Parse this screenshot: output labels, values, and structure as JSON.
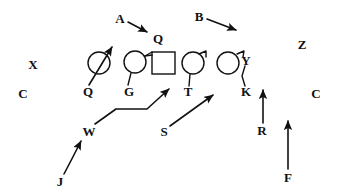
{
  "diagram": {
    "type": "american-football-play-formation",
    "canvas": {
      "width": 337,
      "height": 195
    },
    "stroke_color": "#111111",
    "background_color": "#ffffff",
    "offense": {
      "description": "Offensive line: four circles and one square (ball carrier / center marker)",
      "players": [
        {
          "id": "ol-1",
          "shape": "circle",
          "cx": 99,
          "cy": 63,
          "r": 11,
          "label": "Q",
          "label_x": 88,
          "label_y": 91
        },
        {
          "id": "ol-2",
          "shape": "circle",
          "cx": 135,
          "cy": 62,
          "r": 11,
          "label": "G",
          "label_x": 129,
          "label_y": 91
        },
        {
          "id": "ol-3",
          "shape": "square",
          "x": 152,
          "y": 52,
          "w": 23,
          "h": 22,
          "label": "",
          "label_x": 0,
          "label_y": 0
        },
        {
          "id": "ol-4",
          "shape": "circle",
          "cx": 193,
          "cy": 63,
          "r": 11,
          "label": "T",
          "label_x": 188,
          "label_y": 91
        },
        {
          "id": "ol-5",
          "shape": "circle",
          "cx": 228,
          "cy": 63,
          "r": 11,
          "label": "K",
          "label_x": 246,
          "label_y": 91
        }
      ]
    },
    "labels": [
      {
        "name": "label-A",
        "text": "A",
        "x": 120,
        "y": 18,
        "size": "normal"
      },
      {
        "name": "label-B",
        "text": "B",
        "x": 199,
        "y": 16,
        "size": "normal"
      },
      {
        "name": "label-Q-top",
        "text": "Q",
        "x": 158,
        "y": 38,
        "size": "normal"
      },
      {
        "name": "label-Z",
        "text": "Z",
        "x": 302,
        "y": 44,
        "size": "normal"
      },
      {
        "name": "label-X",
        "text": "X",
        "x": 33,
        "y": 64,
        "size": "normal"
      },
      {
        "name": "label-C-left",
        "text": "C",
        "x": 23,
        "y": 93,
        "size": "normal"
      },
      {
        "name": "label-C-right",
        "text": "C",
        "x": 316,
        "y": 93,
        "size": "normal"
      },
      {
        "name": "label-Y",
        "text": "Y",
        "x": 246,
        "y": 60,
        "size": "normal"
      },
      {
        "name": "label-Q-line",
        "text": "Q",
        "x": 88,
        "y": 91,
        "size": "normal"
      },
      {
        "name": "label-G-line",
        "text": "G",
        "x": 129,
        "y": 91,
        "size": "normal"
      },
      {
        "name": "label-T-line",
        "text": "T",
        "x": 188,
        "y": 91,
        "size": "normal"
      },
      {
        "name": "label-K-line",
        "text": "K",
        "x": 246,
        "y": 91,
        "size": "normal"
      },
      {
        "name": "label-W",
        "text": "W",
        "x": 89,
        "y": 131,
        "size": "normal"
      },
      {
        "name": "label-S",
        "text": "S",
        "x": 164,
        "y": 131,
        "size": "normal"
      },
      {
        "name": "label-R",
        "text": "R",
        "x": 262,
        "y": 130,
        "size": "normal"
      },
      {
        "name": "label-J",
        "text": "J",
        "x": 60,
        "y": 181,
        "size": "normal"
      },
      {
        "name": "label-F",
        "text": "F",
        "x": 288,
        "y": 177,
        "size": "normal"
      }
    ],
    "routes": [
      {
        "name": "route-A",
        "from_label": "A",
        "to_label": "Q",
        "style": "straight-arrow",
        "path": "M128,22 L148,33"
      },
      {
        "name": "route-B",
        "from_label": "B",
        "to_label": "",
        "style": "straight-arrow",
        "path": "M207,19 L237,31"
      },
      {
        "name": "route-Q-block",
        "from_label": "Q",
        "to_label": "",
        "style": "straight-arrow-up-right",
        "path": "M89,85 L112,46"
      },
      {
        "name": "route-W",
        "from_label": "W",
        "to_label": "",
        "style": "bent-arrow",
        "path": "M94,124 L115,110 L147,110 L170,88"
      },
      {
        "name": "route-J",
        "from_label": "J",
        "to_label": "W",
        "style": "curved-arrow",
        "path": "M64,174 Q73,158 82,140"
      },
      {
        "name": "route-S",
        "from_label": "S",
        "to_label": "",
        "style": "straight-arrow",
        "path": "M170,126 L214,94"
      },
      {
        "name": "route-R",
        "from_label": "R",
        "to_label": "",
        "style": "straight-arrow-up",
        "path": "M263,123 L263,89"
      },
      {
        "name": "route-F",
        "from_label": "F",
        "to_label": "",
        "style": "straight-arrow-up",
        "path": "M288,169 L288,120"
      }
    ],
    "stems": [
      {
        "name": "stem-ol-2",
        "path": "M131,73 L128,85"
      },
      {
        "name": "stem-ol-4",
        "path": "M190,74 L189,86"
      },
      {
        "name": "hook-ol-4",
        "path": "M198,54 L205,51 L205,56"
      },
      {
        "name": "hook-ol-5",
        "path": "M236,54 L243,51 L242,57"
      },
      {
        "name": "stem-Y-K",
        "path": "M244,64 L243,75 L245,86"
      },
      {
        "name": "connector-square",
        "path": "M146,56 L152,56"
      }
    ]
  }
}
